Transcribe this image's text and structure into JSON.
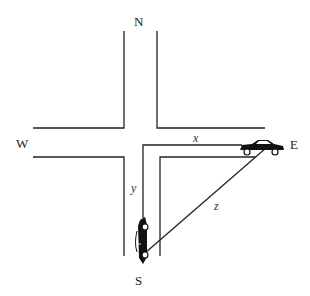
{
  "diagram": {
    "type": "related-rates intersection",
    "compass": {
      "north": "N",
      "south": "S",
      "east": "E",
      "west": "W"
    },
    "variables": {
      "x": "x",
      "y": "y",
      "z": "z"
    },
    "colors": {
      "line": "#222222",
      "car": "#111111",
      "background": "#ffffff"
    }
  }
}
